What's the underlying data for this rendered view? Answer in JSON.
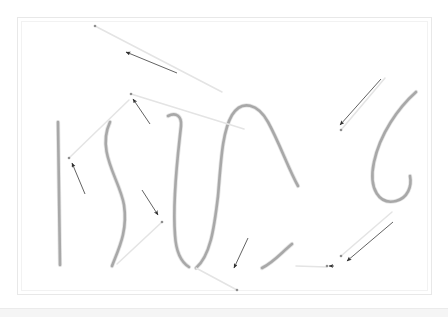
{
  "app": {
    "title": "Sketch Canvas",
    "background_color": "#ffffff"
  },
  "canvas": {
    "name": "drawing-canvas",
    "width": 448,
    "height": 317,
    "frame": {
      "name": "canvas-frame",
      "x": 17,
      "y": 17,
      "width": 414,
      "height": 277,
      "border_color": "#e8e8e8",
      "fill": "#ffffff"
    },
    "inner_frame": {
      "name": "canvas-inner-frame",
      "x": 21,
      "y": 21,
      "width": 406,
      "height": 269,
      "border_color": "#f2f2f2"
    },
    "footer_strip": {
      "name": "canvas-footer-strip",
      "x": 0,
      "y": 308,
      "width": 448,
      "height": 9,
      "color": "#f4f4f4",
      "line_color": "#ebebeb"
    }
  },
  "strokes": {
    "color": "#a8a8a8",
    "highlight_color": "#c9c9c9",
    "width": 2.6,
    "items": [
      {
        "name": "stroke-vertical-line",
        "label": "vertical line",
        "path": "M58,122 L60,265"
      },
      {
        "name": "stroke-s-curve",
        "label": "S curve",
        "path": "M110,122 C96,152 120,180 124,205 C128,232 118,250 112,266"
      },
      {
        "name": "stroke-hook-left",
        "label": "left hook",
        "path": "M168,116 C176,112 182,116 181,126 C179,146 172,196 175,235 C176,252 181,262 189,267"
      },
      {
        "name": "stroke-arch",
        "label": "tall arch",
        "path": "M196,268 C210,256 214,230 218,196 C221,162 222,132 232,115 C242,99 258,104 268,122 C280,144 288,168 298,186"
      },
      {
        "name": "stroke-hook-right",
        "label": "right hook tail",
        "path": "M262,268 C274,262 282,252 292,244"
      },
      {
        "name": "stroke-j-curve",
        "label": "J curve",
        "path": "M416,92 C398,108 380,134 374,162 C368,190 380,205 396,201 C408,198 412,186 410,176"
      }
    ]
  },
  "annotations": {
    "leader_color": "#e4e4e4",
    "arrow_color": "#3a3a3a",
    "dot_color": "#8f8f8f",
    "items": [
      {
        "name": "annotation-1",
        "label": "top-left annotation",
        "dot": {
          "x": 95,
          "y": 26
        },
        "leader": "M95,26 L222,92",
        "arrow": "M177,73 L126,52",
        "tip": {
          "x": 122,
          "y": 50
        }
      },
      {
        "name": "annotation-2",
        "label": "upper-middle annotation",
        "dot": {
          "x": 131,
          "y": 94
        },
        "leader": "M131,94 L244,129",
        "arrow": "M150,124 L133,99",
        "tip": {
          "x": 131,
          "y": 95
        }
      },
      {
        "name": "annotation-3",
        "label": "left annotation",
        "dot": {
          "x": 69,
          "y": 158
        },
        "leader": "M69,158 L129,100",
        "arrow": "M85,194 L72,163",
        "tip": {
          "x": 70,
          "y": 160
        }
      },
      {
        "name": "annotation-4",
        "label": "middle annotation",
        "dot": {
          "x": 162,
          "y": 222
        },
        "leader": "M162,222 L117,264",
        "arrow": "M142,190 L158,215",
        "tip": {
          "x": 161,
          "y": 220
        }
      },
      {
        "name": "annotation-5",
        "label": "lower-middle annotation",
        "dot": {
          "x": 237,
          "y": 290
        },
        "leader": "M237,290 L196,268",
        "arrow": "M248,238 L234,268",
        "tip": {
          "x": 232,
          "y": 271
        }
      },
      {
        "name": "annotation-6",
        "label": "upper-right annotation",
        "dot": {
          "x": 341,
          "y": 130
        },
        "leader": "M341,130 L385,78",
        "arrow": "M381,79 L340,125",
        "tip": {
          "x": 337,
          "y": 129
        }
      },
      {
        "name": "annotation-7",
        "label": "lower-right annotation",
        "dot": {
          "x": 341,
          "y": 256
        },
        "leader": "M341,256 L392,212",
        "arrow": "M393,222 L347,261",
        "tip": {
          "x": 343,
          "y": 264
        }
      },
      {
        "name": "annotation-8",
        "label": "bottom-right tick",
        "dot": {
          "x": 327,
          "y": 266
        },
        "leader": "M327,267 L296,266",
        "arrow": "M334,266 L329,266",
        "tip": {
          "x": 327,
          "y": 266
        }
      }
    ]
  }
}
